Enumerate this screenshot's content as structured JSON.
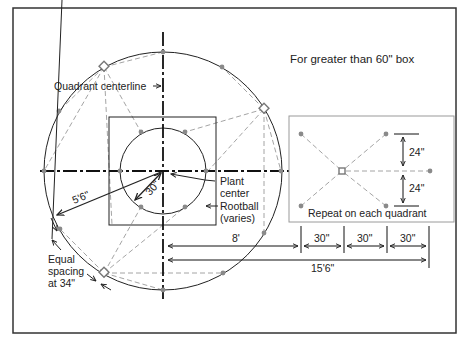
{
  "title": "For greater than 60\" box",
  "labels": {
    "quadrant_centerline": "Quadrant centerline",
    "plant_center_1": "Plant",
    "plant_center_2": "center",
    "rootball_1": "Rootball",
    "rootball_2": "(varies)",
    "radius_outer": "5'6\"",
    "radius_inner": "30\"",
    "equal_1": "Equal",
    "equal_2": "spacing",
    "equal_3": "at 34\""
  },
  "detail_panel": {
    "caption": "Repeat on each quadrant",
    "offset_top": "24\"",
    "offset_bottom": "24\""
  },
  "dimensions": {
    "to_first_ring": "8'",
    "total": "15'6\"",
    "spacing": [
      "30\"",
      "30\"",
      "30\""
    ]
  },
  "colors": {
    "line": "#222222",
    "dashed": "#9a9a9a",
    "point": "#8a8a8a",
    "panel_border": "#9a9a9a"
  }
}
